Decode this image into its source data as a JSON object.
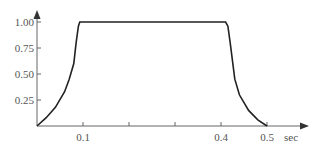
{
  "chart_data": {
    "type": "line",
    "title": "",
    "xlabel": "sec",
    "ylabel": "",
    "xlim": [
      0,
      0.59
    ],
    "ylim": [
      0,
      1.1
    ],
    "grid": false,
    "legend": null,
    "x_ticks": [
      0.1,
      0.2,
      0.3,
      0.4,
      0.5
    ],
    "x_tick_labels": [
      "0.1",
      "",
      "",
      "0.4",
      "0.5"
    ],
    "y_ticks": [
      0.25,
      0.5,
      0.75,
      1.0
    ],
    "y_tick_labels": [
      "0.25",
      "0.50",
      "0.75",
      "1.00"
    ],
    "series": [
      {
        "name": "pulse",
        "x": [
          0,
          0.02,
          0.04,
          0.06,
          0.07,
          0.08,
          0.085,
          0.09,
          0.093,
          0.1,
          0.2,
          0.3,
          0.4,
          0.41,
          0.415,
          0.42,
          0.43,
          0.44,
          0.46,
          0.48,
          0.5
        ],
        "y": [
          0,
          0.08,
          0.18,
          0.33,
          0.45,
          0.6,
          0.8,
          0.96,
          1.0,
          1.0,
          1.0,
          1.0,
          1.0,
          1.0,
          0.96,
          0.8,
          0.45,
          0.3,
          0.15,
          0.06,
          0
        ]
      }
    ]
  }
}
